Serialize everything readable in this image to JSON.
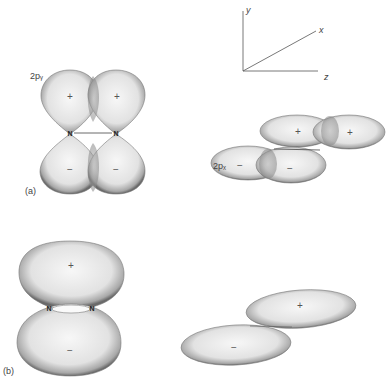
{
  "figure": {
    "axes": {
      "y_label": "y",
      "x_label": "x",
      "z_label": "z"
    },
    "panel_a": {
      "label": "(a)",
      "left_view": {
        "orbital_label": "2pᵧ",
        "atoms": [
          "N",
          "N"
        ],
        "top_lobes": [
          "+",
          "+"
        ],
        "bottom_lobes": [
          "−",
          "−"
        ]
      },
      "right_view": {
        "orbital_label": "2pₓ",
        "top_lobes": [
          "+",
          "+"
        ],
        "bottom_lobes": [
          "−",
          "−"
        ]
      }
    },
    "panel_b": {
      "label": "(b)",
      "left_view": {
        "atoms": [
          "N",
          "N"
        ],
        "top_lobe": "+",
        "bottom_lobe": "−"
      },
      "right_view": {
        "top_lobe": "+",
        "bottom_lobe": "−"
      }
    }
  }
}
